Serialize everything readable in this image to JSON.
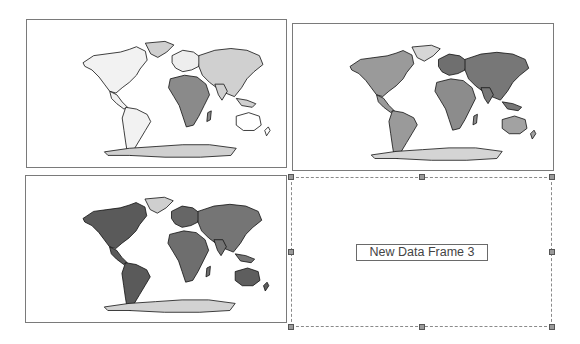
{
  "layout_view": {
    "frames": [
      {
        "name": "Data Frame 1",
        "type": "world-choropleth-map",
        "fills": {
          "americas": "#f2f2f2",
          "europe": "#eeeeee",
          "africa": "#8a8a8a",
          "asia": "#d0d0d0",
          "oceania": "#ffffff",
          "greenland": "#cfcfcf",
          "antarctica": "#d0d0d0"
        }
      },
      {
        "name": "Data Frame 2",
        "type": "world-choropleth-map",
        "fills": {
          "americas": "#9a9a9a",
          "europe": "#6f6f6f",
          "africa": "#8c8c8c",
          "asia": "#777777",
          "oceania": "#a2a2a2",
          "greenland": "#d6d6d6",
          "antarctica": "#d4d4d4"
        }
      },
      {
        "name": "Data Frame 3",
        "type": "world-choropleth-map",
        "fills": {
          "americas": "#5a5a5a",
          "europe": "#666666",
          "africa": "#6e6e6e",
          "asia": "#757575",
          "oceania": "#5e5e5e",
          "greenland": "#cfcfcf",
          "antarctica": "#d2d2d2"
        }
      },
      {
        "name": "New Data Frame 3",
        "type": "empty-data-frame",
        "label": "New Data Frame 3",
        "selected": true
      }
    ]
  }
}
